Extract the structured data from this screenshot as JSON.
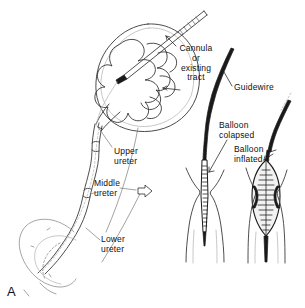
{
  "figure": {
    "panel_letter": "A",
    "background_color": "#ffffff",
    "ink_color": "#1a1a1a",
    "faint_ink_color": "#8d8d8d"
  },
  "labels": {
    "cannula": "Cannula\nor\nexisting\ntract",
    "guidewire": "Guidewire",
    "balloon_collapsed": "Balloon\ncolapsed",
    "balloon_inflated": "Balloon\ninflated",
    "upper_ureter": "Upper\nureter",
    "middle_ureter": "Middle\nureter",
    "lower_ureter": "Lower\nureter"
  },
  "anatomy": {
    "kidney": "kidney-outline",
    "calyces": "renal-calyces",
    "renal_pelvis": "renal-pelvis",
    "ureter": "ureter",
    "bladder": "bladder-outline"
  },
  "devices": {
    "cannula": "percutaneous-cannula",
    "guidewire": "guidewire",
    "balloon_catheter_collapsed": "balloon-catheter-collapsed",
    "balloon_catheter_inflated": "balloon-catheter-inflated",
    "stricture": "ureteric-stricture"
  },
  "markers": {
    "transition_arrow": "hollow-right-arrow"
  }
}
